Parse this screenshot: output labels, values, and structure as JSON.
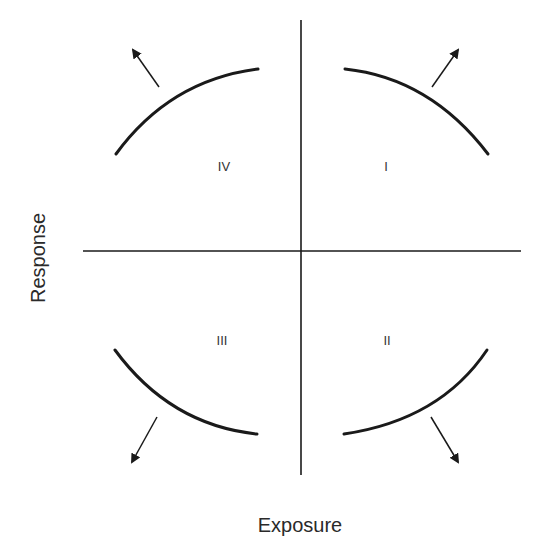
{
  "diagram": {
    "type": "quadrant-diagram",
    "x_axis_label": "Exposure",
    "y_axis_label": "Response",
    "colors": {
      "line": "#1a1a1a",
      "text": "#333333",
      "background": "#ffffff"
    },
    "quadrants": [
      {
        "id": "I",
        "label": "I",
        "position": "upper-right",
        "arrow_direction": "up-right"
      },
      {
        "id": "II",
        "label": "II",
        "position": "lower-right",
        "arrow_direction": "down-right"
      },
      {
        "id": "III",
        "label": "III",
        "position": "lower-left",
        "arrow_direction": "down-left"
      },
      {
        "id": "IV",
        "label": "IV",
        "position": "upper-left",
        "arrow_direction": "up-left"
      }
    ]
  }
}
